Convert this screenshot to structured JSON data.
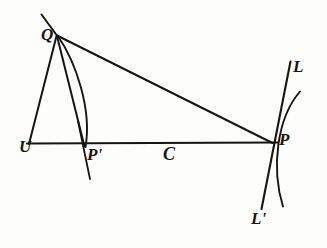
{
  "figure": {
    "type": "geometric-optics-diagram",
    "background_color": "#fdfdfb",
    "ink_color": "#171512",
    "width": 327,
    "height": 248,
    "labels": {
      "Q": "Q",
      "U": "U",
      "P_prime": "P'",
      "C": "C",
      "P": "P",
      "L": "L",
      "L_prime": "L'"
    },
    "points": {
      "Q": {
        "x": 56,
        "y": 35
      },
      "U": {
        "x": 29,
        "y": 143
      },
      "P_prime": {
        "x": 84,
        "y": 146
      },
      "C": {
        "x": 170,
        "y": 146
      },
      "P": {
        "x": 272,
        "y": 143
      },
      "L_top": {
        "x": 290,
        "y": 62
      },
      "L_prime_bottom": {
        "x": 262,
        "y": 208
      },
      "arc_right_top": {
        "x": 300,
        "y": 92
      },
      "arc_right_bottom": {
        "x": 283,
        "y": 206
      },
      "Q_extension_top": {
        "x": 42,
        "y": 15
      },
      "P_prime_line_top": {
        "x": 78,
        "y": 122
      },
      "P_prime_line_bottom": {
        "x": 90,
        "y": 178
      }
    },
    "strokes": [
      {
        "name": "baseline-U-to-P",
        "kind": "line"
      },
      {
        "name": "ray-Q-to-U",
        "kind": "line"
      },
      {
        "name": "ray-Q-to-P-prime",
        "kind": "line"
      },
      {
        "name": "ray-Q-to-P",
        "kind": "line"
      },
      {
        "name": "arc-Q-to-P-prime",
        "kind": "curve"
      },
      {
        "name": "line-through-Q-upper-left",
        "kind": "line"
      },
      {
        "name": "short-line-through-P-prime",
        "kind": "line"
      },
      {
        "name": "line-L-to-L-prime",
        "kind": "line"
      },
      {
        "name": "arc-at-P",
        "kind": "curve"
      }
    ]
  }
}
